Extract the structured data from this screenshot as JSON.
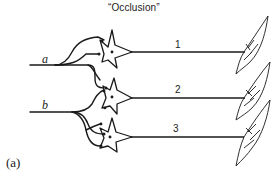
{
  "figure": {
    "title": "“Occlusion”",
    "panel_label": "(a)",
    "inputs": [
      {
        "label": "a"
      },
      {
        "label": "b"
      }
    ],
    "motor_units": [
      {
        "label": "1"
      },
      {
        "label": "2"
      },
      {
        "label": "3"
      }
    ],
    "colors": {
      "ink": "#1a1a1a",
      "background": "#ffffff"
    }
  }
}
